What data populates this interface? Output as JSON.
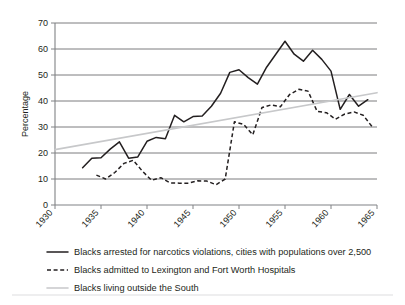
{
  "chart_data": {
    "type": "line",
    "title": "",
    "xlabel": "",
    "ylabel": "Percentage",
    "xlim": [
      1930,
      1965
    ],
    "ylim": [
      0,
      70
    ],
    "grid": true,
    "legend_position": "bottom",
    "x_ticks": [
      "1930",
      "1935",
      "1940",
      "1945",
      "1950",
      "1955",
      "1960",
      "1965"
    ],
    "y_ticks": [
      "0",
      "10",
      "20",
      "30",
      "40",
      "50",
      "60",
      "70"
    ],
    "series": [
      {
        "name": "Blacks arrested for narcotics violations, cities with populations over 2,500",
        "style": "solid",
        "color": "#231f20",
        "x": [
          1933,
          1934,
          1935,
          1936,
          1937,
          1938,
          1939,
          1940,
          1941,
          1942,
          1943,
          1944,
          1945,
          1946,
          1947,
          1948,
          1949,
          1950,
          1951,
          1952,
          1953,
          1954,
          1955,
          1956,
          1957,
          1958,
          1959,
          1960,
          1961,
          1962,
          1963,
          1964
        ],
        "values": [
          14.3,
          18.0,
          18.2,
          21.5,
          24.3,
          18.0,
          18.5,
          24.5,
          26.0,
          25.5,
          34.5,
          32.0,
          34.0,
          34.2,
          38.0,
          43.0,
          51.0,
          52.0,
          49.0,
          46.5,
          53.0,
          58.0,
          63.0,
          58.0,
          55.3,
          59.5,
          56.0,
          51.5,
          36.8,
          42.5,
          38.0,
          40.5
        ]
      },
      {
        "name": "Blacks admitted to Lexington and Fort Worth Hospitals",
        "style": "dashed",
        "color": "#231f20",
        "x": [
          1934.5,
          1935.5,
          1936.5,
          1937.5,
          1938.5,
          1939.5,
          1940.5,
          1941.5,
          1942.5,
          1943.5,
          1944.5,
          1945.5,
          1946.5,
          1947.5,
          1948.5,
          1949.5,
          1950.5,
          1951.5,
          1952.5,
          1953.5,
          1954.5,
          1955.5,
          1956.5,
          1957.5,
          1958.5,
          1959.5,
          1960.5,
          1961.5,
          1962.5,
          1963.5,
          1964.5
        ],
        "values": [
          11.5,
          10.0,
          12.5,
          16.0,
          17.2,
          13.0,
          9.5,
          10.5,
          8.5,
          8.4,
          8.4,
          9.3,
          9.2,
          7.8,
          10.0,
          32.0,
          31.0,
          27.0,
          37.5,
          38.5,
          37.8,
          42.5,
          44.5,
          43.8,
          36.0,
          35.5,
          33.0,
          35.0,
          35.8,
          34.5,
          30.0
        ]
      },
      {
        "name": "Blacks living outside the South",
        "style": "trend",
        "color": "#c7c8ca",
        "x": [
          1930,
          1965
        ],
        "values": [
          21.3,
          43.2
        ]
      }
    ]
  },
  "legend": {
    "items": [
      {
        "label": "Blacks arrested for narcotics violations, cities with populations over 2,500",
        "style": "solid"
      },
      {
        "label": "Blacks admitted to Lexington and Fort Worth Hospitals",
        "style": "dashed"
      },
      {
        "label": "Blacks living outside the South",
        "style": "trend"
      }
    ]
  }
}
